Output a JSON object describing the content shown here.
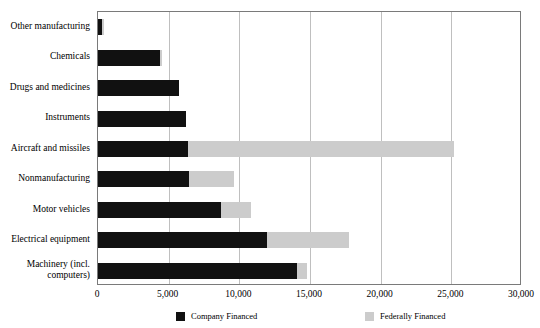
{
  "chart_data": {
    "type": "bar",
    "orientation": "horizontal",
    "stacked": true,
    "title": "",
    "subtitle": "",
    "xlabel": "",
    "ylabel": "",
    "xlim": [
      0,
      30000
    ],
    "grid": true,
    "legend_position": "bottom",
    "categories": [
      "Other manufacturing",
      "Chemicals",
      "Drugs and medicines",
      "Instruments",
      "Aircraft and missiles",
      "Nonmanufacturing",
      "Motor vehicles",
      "Electrical equipment",
      "Machinery (incl. computers)"
    ],
    "tick_labels": [
      "0",
      "5,000",
      "10,000",
      "15,000",
      "20,000",
      "25,000",
      "30,000"
    ],
    "tick_values": [
      0,
      5000,
      10000,
      15000,
      20000,
      25000,
      30000
    ],
    "series": [
      {
        "name": "Company Financed",
        "color": "#111111",
        "values": [
          300,
          4400,
          5700,
          6200,
          6400,
          6450,
          8700,
          11950,
          14050
        ]
      },
      {
        "name": "Federally Financed",
        "color": "#cccccc",
        "values": [
          150,
          150,
          0,
          0,
          18800,
          3150,
          2150,
          5800,
          750
        ]
      }
    ]
  },
  "ylabels": [
    {
      "text": "Other manufacturing",
      "lines": [
        "Other manufacturing"
      ]
    },
    {
      "text": "Chemicals",
      "lines": [
        "Chemicals"
      ]
    },
    {
      "text": "Drugs and medicines",
      "lines": [
        "Drugs and medicines"
      ]
    },
    {
      "text": "Instruments",
      "lines": [
        "Instruments"
      ]
    },
    {
      "text": "Aircraft and missiles",
      "lines": [
        "Aircraft and missiles"
      ]
    },
    {
      "text": "Nonmanufacturing",
      "lines": [
        "Nonmanufacturing"
      ]
    },
    {
      "text": "Motor vehicles",
      "lines": [
        "Motor vehicles"
      ]
    },
    {
      "text": "Electrical equipment",
      "lines": [
        "Electrical equipment"
      ]
    },
    {
      "text": "Machinery (incl. computers)",
      "lines": [
        "Machinery (incl.",
        "computers)"
      ]
    }
  ],
  "legend": {
    "items": [
      {
        "label": "Company Financed",
        "color": "#111111"
      },
      {
        "label": "Federally Financed",
        "color": "#cccccc"
      }
    ]
  }
}
